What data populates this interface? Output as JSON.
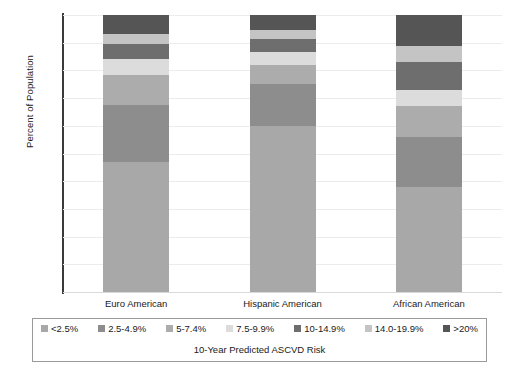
{
  "chart_data": {
    "type": "bar",
    "subtype": "stacked-percent",
    "title": "",
    "xlabel": "",
    "ylabel": "Percent of Population",
    "legend_title": "10-Year Predicted ASCVD Risk",
    "legend_position": "bottom",
    "grid": true,
    "ylim": [
      0,
      100
    ],
    "yticks": [
      0,
      10,
      20,
      30,
      40,
      50,
      60,
      70,
      80,
      90,
      100
    ],
    "categories": [
      "Euro American",
      "Hispanic American",
      "African American"
    ],
    "series": [
      {
        "name": "<2.5%",
        "color": "#a8a8a8",
        "values": [
          47,
          60,
          38
        ]
      },
      {
        "name": "2.5-4.9%",
        "color": "#8d8d8d",
        "values": [
          20.5,
          15,
          18
        ]
      },
      {
        "name": "5-7.4%",
        "color": "#acacac",
        "values": [
          11,
          7,
          11
        ]
      },
      {
        "name": "7.5-9.9%",
        "color": "#dcdcdc",
        "values": [
          5.5,
          4.5,
          6
        ]
      },
      {
        "name": "10-14.9%",
        "color": "#6e6e6e",
        "values": [
          5.5,
          5,
          10
        ]
      },
      {
        "name": "14.0-19.9%",
        "color": "#c4c4c4",
        "values": [
          3.5,
          3,
          6
        ]
      },
      {
        "name": ">20%",
        "color": "#555555",
        "values": [
          7,
          5.5,
          11
        ]
      }
    ]
  }
}
